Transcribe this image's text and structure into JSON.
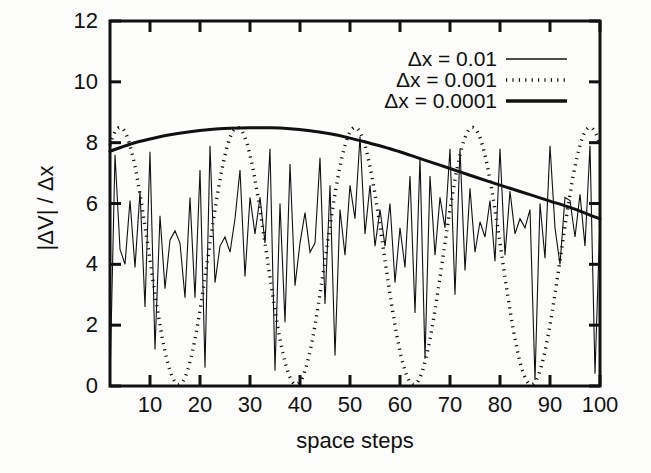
{
  "chart_data": {
    "type": "line",
    "title": "",
    "xlabel": "space steps",
    "ylabel": "|ΔV| / Δx",
    "xlim": [
      2,
      100
    ],
    "ylim": [
      0,
      12
    ],
    "xticks": [
      10,
      20,
      30,
      40,
      50,
      60,
      70,
      80,
      90,
      100
    ],
    "yticks": [
      0,
      2,
      4,
      6,
      8,
      10,
      12
    ],
    "xtick_labels": [
      "10",
      "20",
      "30",
      "40",
      "50",
      "60",
      "70",
      "80",
      "90",
      "100"
    ],
    "ytick_labels": [
      "0",
      "2",
      "4",
      "6",
      "8",
      "10",
      "12"
    ],
    "grid": false,
    "legend_position": "top-right",
    "frame": true,
    "minor_ticks": false,
    "series": [
      {
        "name": "Δx = 0.01",
        "style": "thin-solid",
        "color": "#111111",
        "linewidth": 1.1,
        "x": [
          2,
          3,
          4,
          5,
          6,
          7,
          8,
          9,
          10,
          11,
          12,
          13,
          14,
          15,
          16,
          17,
          18,
          19,
          20,
          21,
          22,
          23,
          24,
          25,
          26,
          27,
          28,
          29,
          30,
          31,
          32,
          33,
          34,
          35,
          36,
          37,
          38,
          39,
          40,
          41,
          42,
          43,
          44,
          45,
          46,
          47,
          48,
          49,
          50,
          51,
          52,
          53,
          54,
          55,
          56,
          57,
          58,
          59,
          60,
          61,
          62,
          63,
          64,
          65,
          66,
          67,
          68,
          69,
          70,
          71,
          72,
          73,
          74,
          75,
          76,
          77,
          78,
          79,
          80,
          81,
          82,
          83,
          84,
          85,
          86,
          87,
          88,
          89,
          90,
          91,
          92,
          93,
          94,
          95,
          96,
          97,
          98,
          99,
          100
        ],
        "y": [
          0.2,
          7.6,
          4.5,
          4.0,
          6.1,
          3.9,
          6.4,
          2.6,
          7.7,
          1.2,
          5.6,
          3.2,
          4.8,
          5.1,
          4.7,
          2.9,
          6.2,
          2.9,
          7.1,
          0.6,
          7.9,
          3.4,
          4.6,
          4.9,
          4.4,
          5.5,
          7.1,
          3.6,
          6.2,
          5.0,
          6.2,
          4.7,
          7.8,
          0.5,
          6.0,
          2.1,
          7.3,
          3.3,
          4.7,
          5.7,
          4.4,
          4.7,
          7.5,
          2.7,
          6.6,
          1.0,
          5.8,
          4.3,
          6.6,
          5.5,
          8.2,
          5.0,
          6.6,
          4.6,
          5.8,
          4.6,
          6.0,
          3.4,
          5.2,
          3.9,
          6.9,
          2.4,
          7.5,
          0.9,
          6.9,
          4.3,
          6.2,
          5.2,
          7.8,
          3.0,
          7.8,
          3.8,
          6.5,
          4.4,
          5.4,
          4.9,
          6.1,
          4.1,
          7.8,
          4.3,
          6.4,
          5.0,
          5.5,
          5.2,
          5.8,
          0.2,
          6.0,
          4.2,
          7.9,
          5.2,
          4.0,
          6.2,
          6.1,
          4.9,
          6.3,
          4.6,
          7.9,
          0.4,
          5.5
        ]
      },
      {
        "name": "Δx = 0.001",
        "style": "dotted",
        "color": "#111111",
        "linewidth": 3.4,
        "period": 23.5,
        "peak": 8.5,
        "trough": 0.05,
        "peaks_at": [
          4,
          28,
          51,
          75,
          99
        ],
        "troughs_at": [
          16,
          39,
          63,
          87
        ]
      },
      {
        "name": "Δx = 0.0001",
        "style": "thick-solid",
        "color": "#111111",
        "linewidth": 3.0,
        "x": [
          2,
          6,
          10,
          14,
          18,
          22,
          26,
          30,
          34,
          38,
          42,
          46,
          50,
          54,
          58,
          62,
          66,
          70,
          74,
          78,
          82,
          86,
          90,
          94,
          98,
          100
        ],
        "y": [
          7.72,
          7.95,
          8.12,
          8.26,
          8.36,
          8.43,
          8.47,
          8.49,
          8.49,
          8.46,
          8.39,
          8.29,
          8.15,
          7.98,
          7.8,
          7.59,
          7.37,
          7.15,
          6.93,
          6.71,
          6.5,
          6.29,
          6.08,
          5.87,
          5.62,
          5.5
        ]
      }
    ]
  },
  "legend": {
    "entries": [
      {
        "label": "Δx = 0.01",
        "style": "thin-solid"
      },
      {
        "label": "Δx = 0.001",
        "style": "dotted"
      },
      {
        "label": "Δx = 0.0001",
        "style": "thick-solid"
      }
    ]
  },
  "axes": {
    "x_title": "space steps",
    "y_title": "|ΔV| / Δx",
    "x_tick_labels": [
      "10",
      "20",
      "30",
      "40",
      "50",
      "60",
      "70",
      "80",
      "90",
      "100"
    ],
    "y_tick_labels": [
      "12",
      "10",
      "8",
      "6",
      "4",
      "2",
      "0"
    ]
  },
  "colors": {
    "ink": "#111111",
    "background": "#fdfdfc"
  }
}
